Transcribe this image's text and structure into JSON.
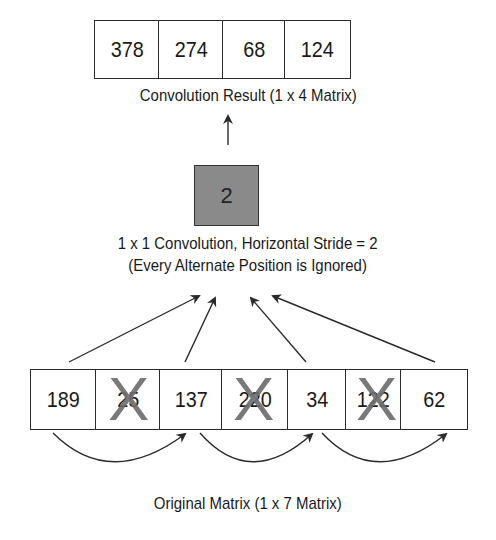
{
  "result": {
    "values": [
      "378",
      "274",
      "68",
      "124"
    ],
    "caption": "Convolution Result (1 x 4 Matrix)"
  },
  "kernel": {
    "value": "2",
    "caption_line1": "1 x 1 Convolution, Horizontal Stride = 2",
    "caption_line2": "(Every Alternate Position is Ignored)"
  },
  "original": {
    "values": [
      "189",
      "25",
      "137",
      "220",
      "34",
      "122",
      "62"
    ],
    "skipped_indices": [
      1,
      3,
      5
    ],
    "caption": "Original Matrix (1 x 7 Matrix)"
  },
  "icons": {
    "skip_mark": "X"
  },
  "colors": {
    "kernel_fill": "#8a8a8a",
    "cross": "#6e6e6e",
    "line": "#2a2a2a"
  }
}
